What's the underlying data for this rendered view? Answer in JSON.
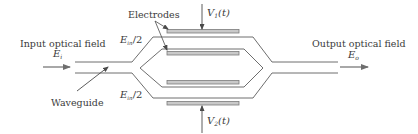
{
  "diagram": {
    "colors": {
      "line": "#6e6e6e",
      "electrode_fill": "#c9c9c9",
      "electrode_stroke": "#7a7a7a",
      "text": "#3a3a3a"
    },
    "labels": {
      "input": "Input optical field",
      "input_field_symbol": "E",
      "input_field_subscript": "i",
      "output": "Output optical field",
      "output_field_symbol": "E",
      "output_field_subscript": "o",
      "waveguide": "Waveguide",
      "electrodes": "Electrodes",
      "upper_arm_symbol": "E",
      "upper_arm_subscript": "in",
      "upper_arm_suffix": "/2",
      "lower_arm_symbol": "E",
      "lower_arm_subscript": "in",
      "lower_arm_suffix": "/2",
      "v1_symbol": "V",
      "v1_subscript": "1",
      "v1_suffix": "(t)",
      "v2_symbol": "V",
      "v2_subscript": "2",
      "v2_suffix": "(t)"
    },
    "nodes": [
      "input-waveguide",
      "y-splitter",
      "upper-arm",
      "lower-arm",
      "y-combiner",
      "output-waveguide",
      "electrode-top",
      "electrode-upper-inner",
      "electrode-lower-inner",
      "electrode-bottom"
    ]
  }
}
